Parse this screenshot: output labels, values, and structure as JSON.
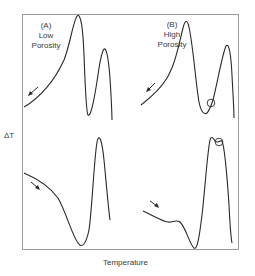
{
  "figure": {
    "type": "dta-curves",
    "ylabel": "ΔT",
    "xlabel": "Temperature",
    "panels": [
      {
        "id": "A",
        "label_line1": "(A)",
        "label_line2": "Low",
        "label_line3": "Porosity",
        "upper_curve": "cooling (arrow pointing down-left)",
        "lower_curve": "heating (arrow pointing down-right)"
      },
      {
        "id": "B",
        "label_line1": "(B)",
        "label_line2": "High",
        "label_line3": "Porosity",
        "upper_curve": "cooling (arrow pointing down-left), circled point on rising limb after minimum",
        "lower_curve": "heating (arrow pointing down-right), circled point at top of exothermic peak"
      }
    ],
    "colors": {
      "line": "#2a2a2a",
      "frame": "#9a9a9a",
      "text": "#3a3a3a"
    }
  }
}
